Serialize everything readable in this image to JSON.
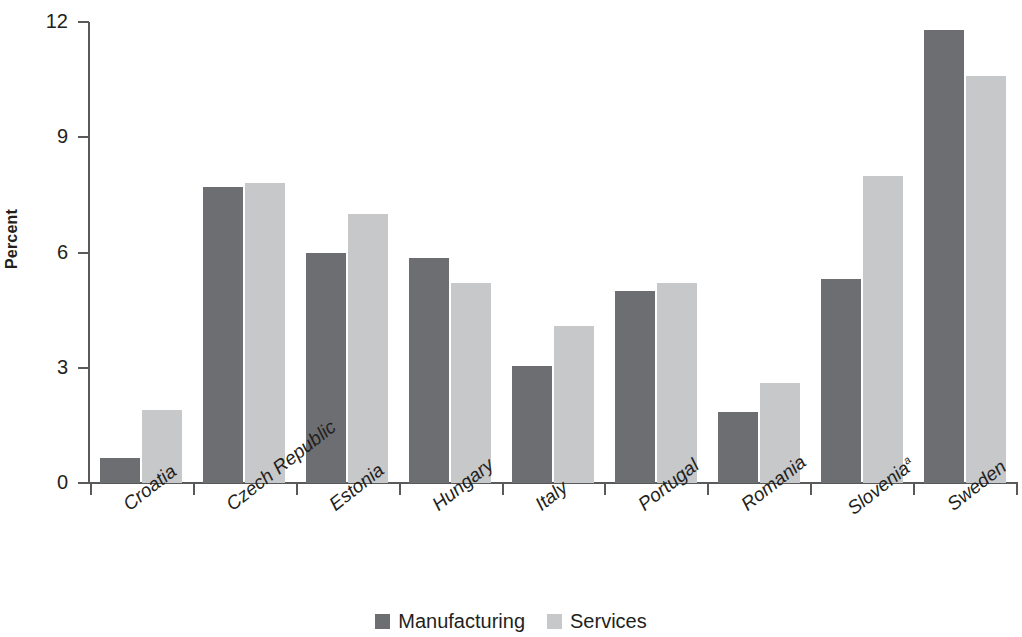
{
  "chart_data": {
    "type": "bar",
    "title": "",
    "xlabel": "",
    "ylabel": "Percent",
    "ylim": [
      0,
      12
    ],
    "yticks": [
      0,
      3,
      6,
      9,
      12
    ],
    "ytick_labels": [
      "0",
      "3",
      "6",
      "9",
      "12"
    ],
    "grid": false,
    "legend_position": "bottom-center",
    "categories": [
      "Croatia",
      "Czech Republic",
      "Estonia",
      "Hungary",
      "Italy",
      "Portugal",
      "Romania",
      "Slovenia",
      "Sweden"
    ],
    "category_footnote_markers": [
      "",
      "",
      "",
      "",
      "",
      "",
      "",
      "a",
      ""
    ],
    "series": [
      {
        "name": "Manufacturing",
        "color": "#6d6e71",
        "values": [
          0.65,
          7.7,
          6.0,
          5.85,
          3.05,
          5.0,
          1.85,
          5.3,
          11.8
        ]
      },
      {
        "name": "Services",
        "color": "#c7c8ca",
        "values": [
          1.9,
          7.8,
          7.0,
          5.2,
          4.1,
          5.2,
          2.6,
          8.0,
          10.6
        ]
      }
    ]
  },
  "legend": {
    "items": [
      {
        "label": "Manufacturing",
        "swatch": "dark"
      },
      {
        "label": "Services",
        "swatch": "light"
      }
    ]
  }
}
